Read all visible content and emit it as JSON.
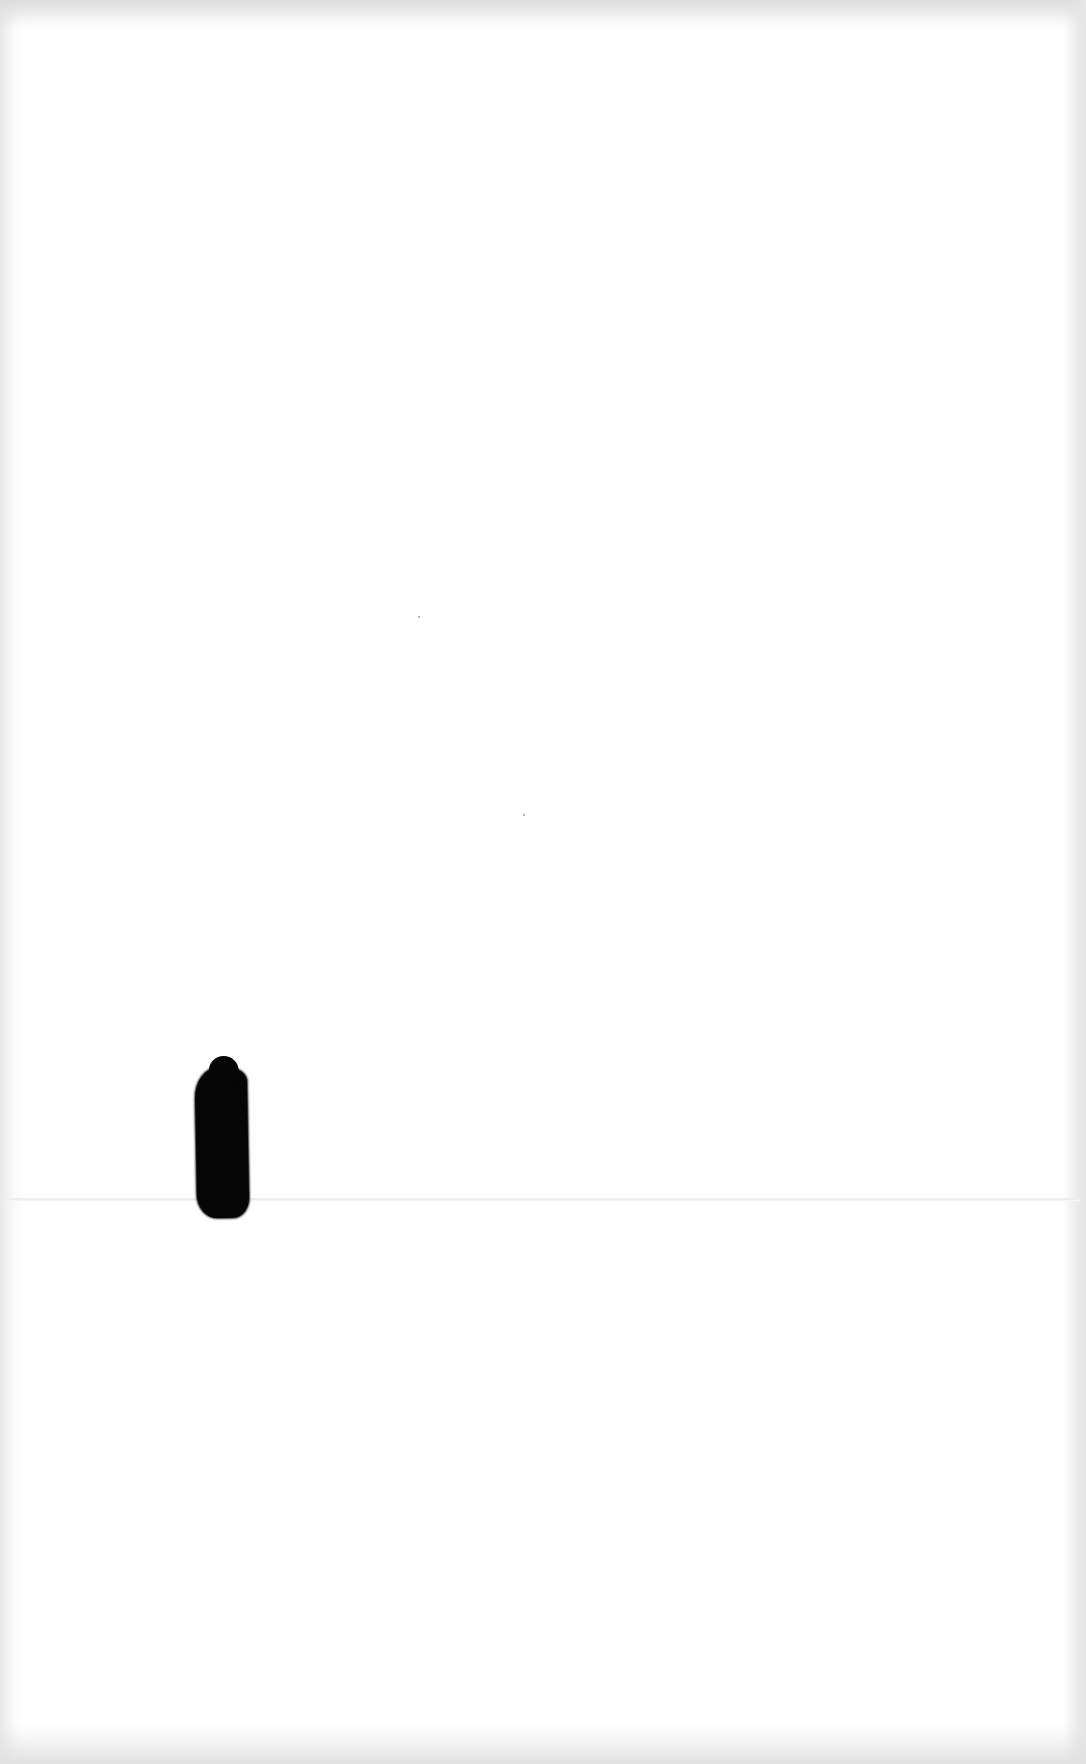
{
  "document": {
    "type": "scanned-page",
    "text": "",
    "has_fold_line": true,
    "marks": [
      {
        "kind": "ink-blot",
        "color": "#050505"
      }
    ]
  },
  "colors": {
    "paper": "#ffffff",
    "edge_shadow": "#e0e0e0",
    "ink": "#050505"
  }
}
